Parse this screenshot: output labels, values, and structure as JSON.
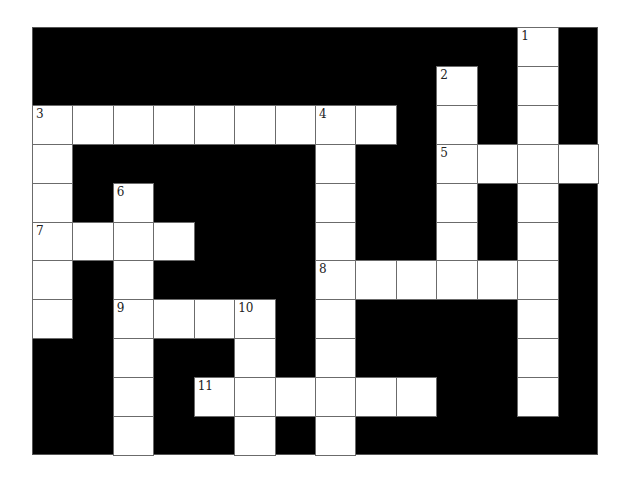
{
  "puzzle": {
    "rows": 11,
    "cols": 14,
    "colors": {
      "block": "#000000",
      "cell": "#ffffff",
      "line": "#6b6b6b",
      "number": "#222222"
    },
    "entries": [
      {
        "number": "1",
        "direction": "down",
        "row": 0,
        "col": 12,
        "length": 10
      },
      {
        "number": "2",
        "direction": "down",
        "row": 1,
        "col": 10,
        "length": 6
      },
      {
        "number": "3",
        "direction": "across",
        "row": 2,
        "col": 0,
        "length": 9
      },
      {
        "number": "3",
        "direction": "down",
        "row": 2,
        "col": 0,
        "length": 6
      },
      {
        "number": "4",
        "direction": "down",
        "row": 2,
        "col": 7,
        "length": 9
      },
      {
        "number": "5",
        "direction": "across",
        "row": 3,
        "col": 10,
        "length": 4
      },
      {
        "number": "6",
        "direction": "down",
        "row": 4,
        "col": 2,
        "length": 7
      },
      {
        "number": "7",
        "direction": "across",
        "row": 5,
        "col": 0,
        "length": 4
      },
      {
        "number": "8",
        "direction": "across",
        "row": 6,
        "col": 7,
        "length": 6
      },
      {
        "number": "9",
        "direction": "across",
        "row": 7,
        "col": 2,
        "length": 4
      },
      {
        "number": "10",
        "direction": "down",
        "row": 7,
        "col": 5,
        "length": 4
      },
      {
        "number": "11",
        "direction": "across",
        "row": 9,
        "col": 4,
        "length": 6
      }
    ],
    "labels": [
      {
        "text": "1",
        "row": 0,
        "col": 12
      },
      {
        "text": "2",
        "row": 1,
        "col": 10
      },
      {
        "text": "3",
        "row": 2,
        "col": 0
      },
      {
        "text": "4",
        "row": 2,
        "col": 7
      },
      {
        "text": "5",
        "row": 3,
        "col": 10
      },
      {
        "text": "6",
        "row": 4,
        "col": 2
      },
      {
        "text": "7",
        "row": 5,
        "col": 0
      },
      {
        "text": "8",
        "row": 6,
        "col": 7
      },
      {
        "text": "9",
        "row": 7,
        "col": 2
      },
      {
        "text": "10",
        "row": 7,
        "col": 5
      },
      {
        "text": "11",
        "row": 9,
        "col": 4
      }
    ]
  }
}
